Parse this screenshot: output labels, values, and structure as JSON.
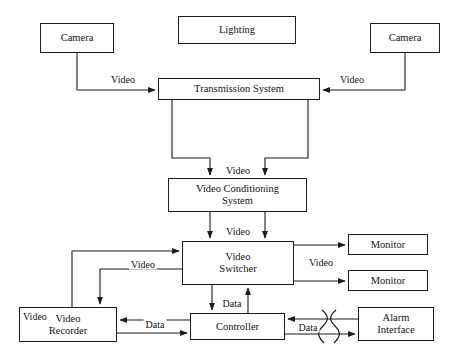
{
  "diagram": {
    "line_color": "#1a1a1a",
    "background_color": "#ffffff",
    "nodes": [
      {
        "id": "camera_left",
        "label": "Camera",
        "x": 40,
        "y": 23,
        "w": 74,
        "h": 30
      },
      {
        "id": "lighting",
        "label": "Lighting",
        "x": 178,
        "y": 16,
        "w": 118,
        "h": 28
      },
      {
        "id": "camera_right",
        "label": "Camera",
        "x": 370,
        "y": 23,
        "w": 70,
        "h": 30
      },
      {
        "id": "transmission",
        "label": "Transmission System",
        "x": 158,
        "y": 78,
        "w": 162,
        "h": 22
      },
      {
        "id": "conditioning",
        "label": "Video Conditioning\nSystem",
        "x": 168,
        "y": 178,
        "w": 139,
        "h": 34
      },
      {
        "id": "switcher",
        "label": "Video\nSwitcher",
        "x": 182,
        "y": 241,
        "w": 112,
        "h": 44
      },
      {
        "id": "monitor_top",
        "label": "Monitor",
        "x": 348,
        "y": 234,
        "w": 80,
        "h": 21
      },
      {
        "id": "monitor_bottom",
        "label": "Monitor",
        "x": 348,
        "y": 270,
        "w": 80,
        "h": 21
      },
      {
        "id": "recorder",
        "label": "Video\nRecorder",
        "x": 19,
        "y": 307,
        "w": 98,
        "h": 35
      },
      {
        "id": "controller",
        "label": "Controller",
        "x": 190,
        "y": 313,
        "w": 95,
        "h": 27
      },
      {
        "id": "alarm",
        "label": "Alarm\nInterface",
        "x": 358,
        "y": 307,
        "w": 76,
        "h": 34
      }
    ],
    "edge_labels": [
      {
        "id": "video_cam_left_to_transmission",
        "text": "Video",
        "x": 123,
        "y": 79
      },
      {
        "id": "video_cam_right_to_transmission",
        "text": "Video",
        "x": 352,
        "y": 79
      },
      {
        "id": "video_transmission_to_conditioning",
        "text": "Video",
        "x": 238,
        "y": 170
      },
      {
        "id": "video_conditioning_to_switcher",
        "text": "Video",
        "x": 238,
        "y": 231
      },
      {
        "id": "video_switcher_to_monitors",
        "text": "Video",
        "x": 321,
        "y": 262
      },
      {
        "id": "video_switcher_recorder",
        "text": "Video",
        "x": 143,
        "y": 264
      },
      {
        "id": "video_recorder_label",
        "text": "Video",
        "x": 21,
        "y": 316
      },
      {
        "id": "data_switcher_controller",
        "text": "Data",
        "x": 232,
        "y": 303
      },
      {
        "id": "data_recorder_controller",
        "text": "Data",
        "x": 155,
        "y": 324
      },
      {
        "id": "data_controller_alarm",
        "text": "Data",
        "x": 308,
        "y": 327
      }
    ]
  }
}
